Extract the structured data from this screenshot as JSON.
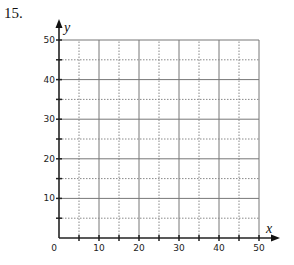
{
  "problem": {
    "number": "15."
  },
  "chart_data": {
    "type": "scatter",
    "title": "",
    "xlabel": "x",
    "ylabel": "y",
    "xlim": [
      0,
      50
    ],
    "ylim": [
      0,
      50
    ],
    "x_ticks": [
      0,
      10,
      20,
      30,
      40,
      50
    ],
    "y_ticks": [
      10,
      20,
      30,
      40,
      50
    ],
    "x_tick_labels": [
      "0",
      "10",
      "20",
      "30",
      "40",
      "50"
    ],
    "y_tick_labels": [
      "10",
      "20",
      "30",
      "40",
      "50"
    ],
    "minor_grid_step": 5,
    "major_grid_step": 10,
    "grid": true,
    "series": [],
    "note": "Blank coordinate grid; no data plotted"
  },
  "colors": {
    "axis": "#222222",
    "grid_major": "#777777",
    "grid_minor": "#888888"
  }
}
